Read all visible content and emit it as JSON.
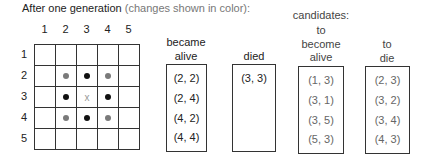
{
  "title": {
    "main": "After one generation",
    "note": "(changes shown in color):"
  },
  "grid": {
    "col_labels": [
      "1",
      "2",
      "3",
      "4",
      "5"
    ],
    "row_labels": [
      "1",
      "2",
      "3",
      "4",
      "5"
    ],
    "cells": [
      [
        "",
        "",
        "",
        "",
        ""
      ],
      [
        "",
        "born",
        "alive",
        "born",
        ""
      ],
      [
        "",
        "alive",
        "died",
        "alive",
        ""
      ],
      [
        "",
        "born",
        "alive",
        "born",
        ""
      ],
      [
        "",
        "",
        "",
        "",
        ""
      ]
    ],
    "died_marker": "x",
    "colors": {
      "alive": "#111111",
      "born": "#7a7a7a",
      "died_marker": "#999999"
    }
  },
  "lists": {
    "became_alive": {
      "label_lines": [
        "became",
        "alive"
      ],
      "entries": [
        "(2, 2)",
        "(2, 4)",
        "(4, 2)",
        "(4, 4)"
      ]
    },
    "died": {
      "label_lines": [
        "died"
      ],
      "entries": [
        "(3, 3)"
      ]
    },
    "candidates_header": "candidates:",
    "to_become_alive": {
      "label_lines": [
        "to",
        "become",
        "alive"
      ],
      "entries": [
        "(1, 3)",
        "(3, 1)",
        "(3, 5)",
        "(5, 3)"
      ]
    },
    "to_die": {
      "label_lines": [
        "to",
        "die"
      ],
      "entries": [
        "(2, 3)",
        "(3, 2)",
        "(3, 4)",
        "(4, 3)"
      ]
    }
  }
}
